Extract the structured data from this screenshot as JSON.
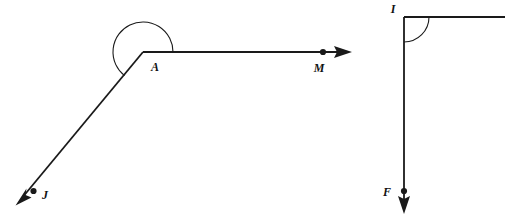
{
  "figure": {
    "background_color": "#ffffff",
    "stroke_color": "#1a1a1a",
    "label_color": "#111111"
  },
  "left_diagram": {
    "name": "reflex-angle-JAM",
    "vertex_label": "A",
    "vertex": {
      "x": 143,
      "y": 52
    },
    "arc": {
      "radius": 30,
      "kind": "reflex-angle-arc",
      "start_angle_deg": 0,
      "end_angle_deg": 232,
      "sweep": "counterclockwise"
    },
    "rays": [
      {
        "name": "ray-AM",
        "endpoint_label": "M",
        "label_position": {
          "x": 323,
          "y": 70
        },
        "dot": {
          "x": 323,
          "y": 52
        },
        "from": {
          "x": 143,
          "y": 52
        },
        "to": {
          "x": 352,
          "y": 52
        },
        "direction": "right",
        "has_arrowhead": true,
        "has_dot": true
      },
      {
        "name": "ray-AJ",
        "endpoint_label": "J",
        "label_position": {
          "x": 43,
          "y": 198
        },
        "dot": {
          "x": 33,
          "y": 191
        },
        "from": {
          "x": 143,
          "y": 52
        },
        "to": {
          "x": 16,
          "y": 205
        },
        "direction": "down-left",
        "has_arrowhead": true,
        "has_dot": true
      }
    ],
    "vertex_label_position": {
      "x": 151,
      "y": 71
    }
  },
  "right_diagram": {
    "name": "right-angle-FI",
    "vertex_label": "I",
    "vertex": {
      "x": 404,
      "y": 17
    },
    "arc": {
      "radius": 25,
      "kind": "right-angle-arc",
      "start_angle_deg": 0,
      "end_angle_deg": 90,
      "sweep": "clockwise-down"
    },
    "rays": [
      {
        "name": "ray-I-right",
        "endpoint_label": "",
        "from": {
          "x": 404,
          "y": 17
        },
        "to": {
          "x": 505,
          "y": 17
        },
        "direction": "right",
        "has_arrowhead": false,
        "has_dot": false
      },
      {
        "name": "ray-IF",
        "endpoint_label": "F",
        "label_position": {
          "x": 391,
          "y": 196
        },
        "dot": {
          "x": 404,
          "y": 191
        },
        "from": {
          "x": 404,
          "y": 17
        },
        "to": {
          "x": 404,
          "y": 214
        },
        "direction": "down",
        "has_arrowhead": true,
        "has_dot": true
      }
    ],
    "vertex_label_position": {
      "x": 396,
      "y": 12
    }
  },
  "labels": {
    "A": "A",
    "M": "M",
    "J": "J",
    "I": "I",
    "F": "F"
  }
}
